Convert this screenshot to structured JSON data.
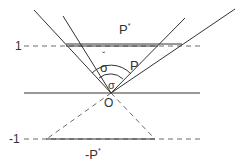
{
  "diagram": {
    "type": "geometric-cone-diagram",
    "labels": {
      "p_star": "P",
      "p_star_sup": "*",
      "p": "P",
      "sigma_check": "σ",
      "sigma_check_accent": "ˇ",
      "sigma": "σ",
      "origin": "O",
      "level_one": "1",
      "level_minus_one": "-1",
      "neg_p_star": "-P",
      "neg_p_star_sup": "*"
    },
    "colors": {
      "line": "#333333",
      "background": "#ffffff"
    }
  }
}
